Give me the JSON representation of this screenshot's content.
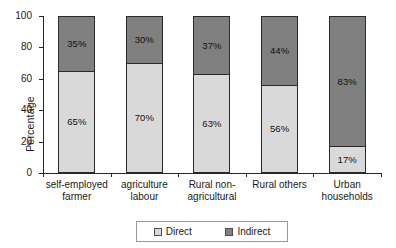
{
  "chart_data": {
    "type": "bar",
    "subtype": "stacked-100-percent",
    "title": "",
    "xlabel": "",
    "ylabel": "Percentage",
    "ylim": [
      0,
      100
    ],
    "yticks": [
      0,
      20,
      40,
      60,
      80,
      100
    ],
    "grid": false,
    "legend_position": "bottom",
    "categories": [
      "self-employed farmer",
      "agriculture labour",
      "Rural non-agricultural",
      "Rural others",
      "Urban households"
    ],
    "category_lines": [
      [
        "self-employed",
        "farmer"
      ],
      [
        "agriculture",
        "labour"
      ],
      [
        "Rural non-",
        "agricultural"
      ],
      [
        "Rural others",
        ""
      ],
      [
        "Urban",
        "households"
      ]
    ],
    "series": [
      {
        "name": "Direct",
        "color": "#d9d9d9",
        "values": [
          65,
          70,
          63,
          56,
          17
        ],
        "labels": [
          "65%",
          "70%",
          "63%",
          "56%",
          "17%"
        ]
      },
      {
        "name": "Indirect",
        "color": "#808080",
        "values": [
          35,
          30,
          37,
          44,
          83
        ],
        "labels": [
          "35%",
          "30%",
          "37%",
          "44%",
          "83%"
        ]
      }
    ]
  },
  "axis": {
    "y_label": "Percentage",
    "y_tick_labels": [
      "100",
      "80",
      "60",
      "40",
      "20",
      "0"
    ]
  },
  "legend": {
    "items": [
      {
        "label": "Direct",
        "color": "#d9d9d9"
      },
      {
        "label": "Indirect",
        "color": "#808080"
      }
    ]
  }
}
